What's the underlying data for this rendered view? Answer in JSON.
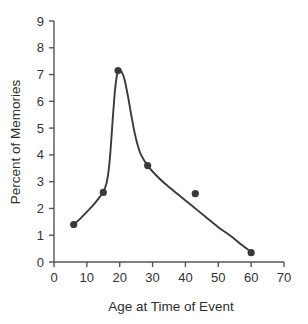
{
  "chart_data": {
    "type": "scatter",
    "title": "",
    "subtitle": "",
    "xlabel": "Age at Time of Event",
    "ylabel": "Percent of Memories",
    "xlim": [
      0,
      70
    ],
    "ylim": [
      0,
      9
    ],
    "xticks": [
      0,
      10,
      20,
      30,
      40,
      50,
      60,
      70
    ],
    "yticks": [
      0,
      1,
      2,
      3,
      4,
      5,
      6,
      7,
      8,
      9
    ],
    "xtick_labels": [
      "0",
      "10",
      "20",
      "30",
      "40",
      "50",
      "60",
      "70"
    ],
    "ytick_labels": [
      "0",
      "1",
      "2",
      "3",
      "4",
      "5",
      "6",
      "7",
      "8",
      "9"
    ],
    "grid": false,
    "legend": null,
    "legend_position": "none",
    "marker_color": "#3a3a3a",
    "line_color": "#3a3a3a",
    "axis_color": "#555555",
    "background_color": "#ffffff",
    "points": [
      {
        "x": 6.0,
        "y": 1.4
      },
      {
        "x": 15.0,
        "y": 2.6
      },
      {
        "x": 19.5,
        "y": 7.15
      },
      {
        "x": 28.5,
        "y": 3.6
      },
      {
        "x": 43.0,
        "y": 2.55
      },
      {
        "x": 60.0,
        "y": 0.35
      }
    ],
    "fit_curve": [
      {
        "x": 6.0,
        "y": 1.4
      },
      {
        "x": 8.0,
        "y": 1.62
      },
      {
        "x": 10.0,
        "y": 1.87
      },
      {
        "x": 12.0,
        "y": 2.13
      },
      {
        "x": 14.0,
        "y": 2.44
      },
      {
        "x": 15.0,
        "y": 2.62
      },
      {
        "x": 16.0,
        "y": 2.95
      },
      {
        "x": 16.8,
        "y": 3.6
      },
      {
        "x": 17.4,
        "y": 4.5
      },
      {
        "x": 18.0,
        "y": 5.55
      },
      {
        "x": 18.6,
        "y": 6.45
      },
      {
        "x": 19.2,
        "y": 7.0
      },
      {
        "x": 19.8,
        "y": 7.17
      },
      {
        "x": 20.6,
        "y": 7.1
      },
      {
        "x": 21.5,
        "y": 6.8
      },
      {
        "x": 22.5,
        "y": 6.2
      },
      {
        "x": 23.5,
        "y": 5.5
      },
      {
        "x": 24.5,
        "y": 4.85
      },
      {
        "x": 25.5,
        "y": 4.35
      },
      {
        "x": 26.5,
        "y": 4.0
      },
      {
        "x": 28.5,
        "y": 3.6
      },
      {
        "x": 31.0,
        "y": 3.25
      },
      {
        "x": 34.0,
        "y": 2.9
      },
      {
        "x": 38.0,
        "y": 2.5
      },
      {
        "x": 42.0,
        "y": 2.1
      },
      {
        "x": 46.0,
        "y": 1.7
      },
      {
        "x": 50.0,
        "y": 1.3
      },
      {
        "x": 54.0,
        "y": 0.95
      },
      {
        "x": 57.0,
        "y": 0.65
      },
      {
        "x": 60.0,
        "y": 0.37
      }
    ]
  }
}
